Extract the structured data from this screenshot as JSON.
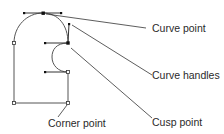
{
  "labels": {
    "curve_point": "Curve point",
    "curve_handles": "Curve handles",
    "cusp_point": "Cusp point",
    "corner_point": "Corner point"
  },
  "colors": {
    "stroke": "#555555",
    "leader": "#333333",
    "point_fill": "#111111",
    "text": "#2a2a2a"
  }
}
